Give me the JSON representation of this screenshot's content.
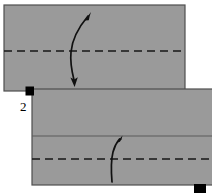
{
  "diagram": {
    "step_label": "2",
    "colors": {
      "paper_fill": "#9a9a9a",
      "paper_outline": "#4d4d4d",
      "fold_line": "#1a1a1a",
      "arrow": "#111111",
      "marker": "#000000",
      "background": "#ffffff"
    },
    "shapes": [
      {
        "name": "upper-sheet",
        "type": "rectangle",
        "x": 4,
        "y": 5,
        "width": 181,
        "height": 86,
        "fill": "#9a9a9a"
      },
      {
        "name": "lower-sheet",
        "type": "rectangle",
        "x": 32,
        "y": 89,
        "width": 180,
        "height": 96,
        "fill": "#9a9a9a"
      }
    ],
    "fold_lines": [
      {
        "name": "upper-sheet-fold-line",
        "style": "dashed",
        "x1": 4,
        "y1": 51,
        "x2": 185,
        "y2": 51
      },
      {
        "name": "lower-sheet-crease-line",
        "style": "solid",
        "x1": 32,
        "y1": 136,
        "x2": 212,
        "y2": 136
      },
      {
        "name": "lower-sheet-fold-line",
        "style": "dashed",
        "x1": 32,
        "y1": 159,
        "x2": 212,
        "y2": 159
      }
    ],
    "arrows": [
      {
        "name": "upper-fold-arrow",
        "description": "double-headed curved arrow indicating fold over and back",
        "heads": [
          "up-right",
          "down"
        ]
      },
      {
        "name": "lower-fold-arrow",
        "description": "curved arrow pointing up indicating fold upward",
        "heads": [
          "up"
        ]
      }
    ],
    "markers": [
      {
        "name": "corner-marker-left",
        "x": 26,
        "y": 87,
        "size": 8
      },
      {
        "name": "corner-marker-right",
        "x": 194,
        "y": 184,
        "size": 12
      }
    ]
  }
}
